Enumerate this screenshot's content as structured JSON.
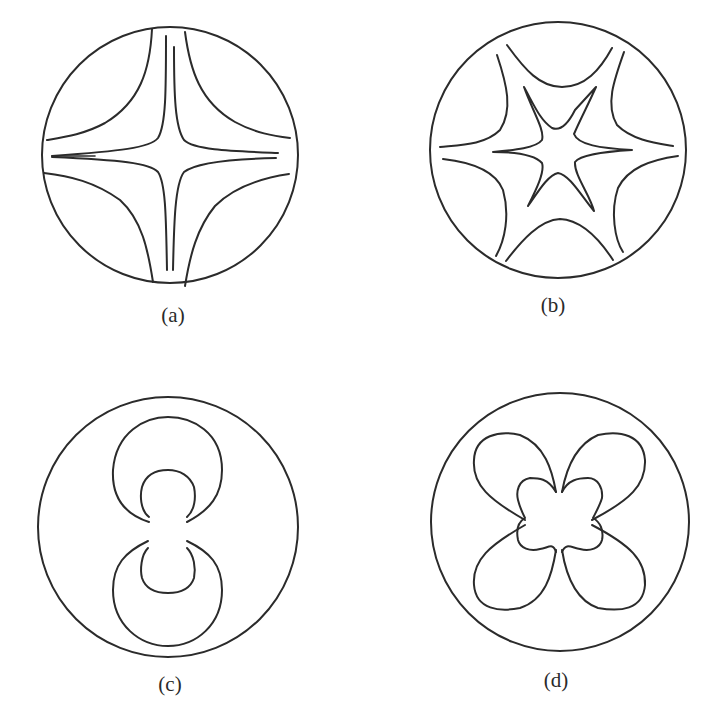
{
  "figure": {
    "panels": [
      {
        "id": "a",
        "label": "(a)",
        "description": "Circular cross-section with four outer hyperbolic curves and an inner four-pointed star pattern"
      },
      {
        "id": "b",
        "label": "(b)",
        "description": "Circular cross-section with six outer hyperbolic curves and an inner six-pointed star pattern"
      },
      {
        "id": "c",
        "label": "(c)",
        "description": "Circular cross-section with two opposing crescent shapes (upper and lower)"
      },
      {
        "id": "d",
        "label": "(d)",
        "description": "Circular cross-section with four outer petal lobes and an inner four-lobed flower shape"
      }
    ],
    "colors": {
      "stroke": "#2b2b2b",
      "background": "#ffffff"
    }
  }
}
